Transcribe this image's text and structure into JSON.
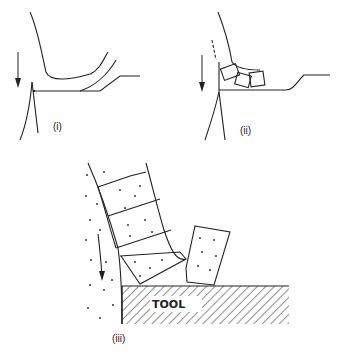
{
  "panels": [
    {
      "id": "i",
      "label": "(i)",
      "description": "Continuous chip flowing along tool rake face"
    },
    {
      "id": "ii",
      "label": "(ii)",
      "description": "Segmented chip with discrete elements"
    },
    {
      "id": "iii",
      "label": "(iii)",
      "description": "Enlarged view of segmented chip elements on tool",
      "tool_label": "TOOL"
    }
  ],
  "colors": {
    "line": "#222222",
    "background": "#ffffff"
  }
}
